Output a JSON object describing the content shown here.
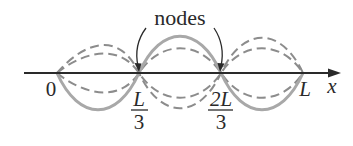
{
  "diagram": {
    "callout_label": "nodes",
    "axis": {
      "variable": "x",
      "ticks": [
        {
          "id": "zero",
          "label": "0",
          "x_px": 57
        },
        {
          "id": "l3",
          "numerator": "L",
          "denominator": "3",
          "x_px": 139
        },
        {
          "id": "2l3",
          "numerator": "2L",
          "denominator": "3",
          "x_px": 221
        },
        {
          "id": "l",
          "label": "L",
          "x_px": 303
        }
      ]
    },
    "waves": {
      "solid": {
        "style": "solid",
        "color": "#a8a8a8",
        "amplitude_px": 34,
        "sign": -1
      },
      "dashed_outer": {
        "style": "dashed",
        "color": "#8c8c8c",
        "amplitude_px": 32,
        "sign": 1
      },
      "dashed_inner": {
        "style": "dashed",
        "color": "#8c8c8c",
        "amplitude_px": 22,
        "sign": 1
      }
    },
    "colors": {
      "axis": "#2a2a2a",
      "text": "#2a2a2a",
      "solid_wave": "#a8a8a8",
      "dashed_wave": "#8c8c8c"
    }
  }
}
